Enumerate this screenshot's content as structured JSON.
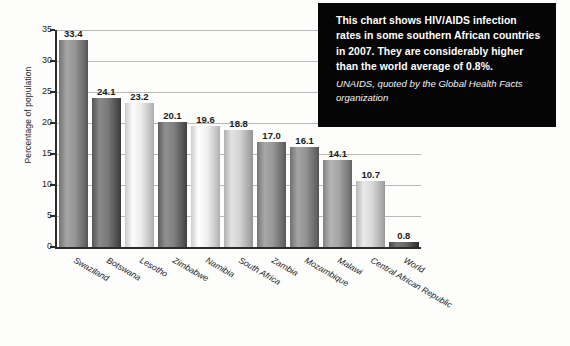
{
  "callout": {
    "main_text": "This chart shows HIV/AIDS infection rates in some southern African countries in 2007. They are considerably higher than the world average of 0.8%.",
    "source_text": "UNAIDS, quoted by the Global Health Facts organization",
    "background_color": "#050505",
    "text_color": "#ffffff"
  },
  "chart_data": {
    "type": "bar",
    "title": "",
    "xlabel": "",
    "ylabel": "Percentage of population",
    "ylim": [
      0,
      35
    ],
    "yticks": [
      0,
      5,
      10,
      15,
      20,
      25,
      30,
      35
    ],
    "ytick_labels": [
      "0",
      "5",
      "10",
      "15",
      "20",
      "25",
      "30",
      "35"
    ],
    "grid": true,
    "legend": false,
    "categories": [
      "Swaziland",
      "Botswana",
      "Lesotho",
      "Zimbabwe",
      "Namibia",
      "South Africa",
      "Zambia",
      "Mozambique",
      "Malawi",
      "Central African Republic",
      "World"
    ],
    "values": [
      33.4,
      24.1,
      23.2,
      20.1,
      19.6,
      18.8,
      17.0,
      16.1,
      14.1,
      10.7,
      0.8
    ],
    "value_labels": [
      "33.4",
      "24.1",
      "23.2",
      "20.1",
      "19.6",
      "18.8",
      "17.0",
      "16.1",
      "14.1",
      "10.7",
      "0.8"
    ],
    "bar_colors": [
      "#8c8c8c",
      "#6f6f6f",
      "#e2e2e2",
      "#767676",
      "#e6e6e6",
      "#c9c9c9",
      "#8e8e8e",
      "#8a8a8a",
      "#9b9b9b",
      "#cfcfcf",
      "#5f5f5f"
    ],
    "axis_color": "#2b2b2b",
    "gridline_color": "#b9b9b9",
    "background_color": "#fdfdfc"
  }
}
